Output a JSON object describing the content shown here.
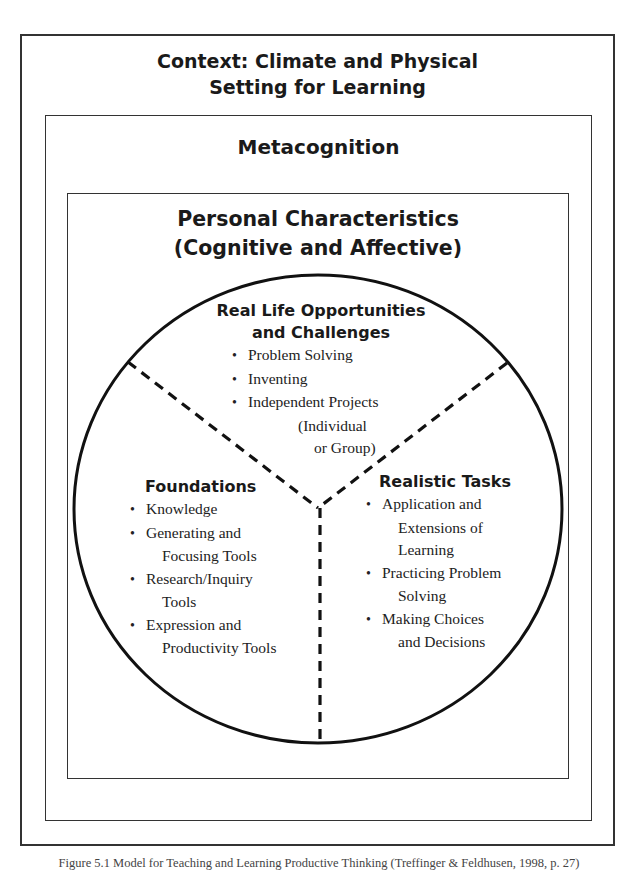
{
  "figure": {
    "outer_box": {
      "title": "Context: Climate and Physical Setting for Learning",
      "title_lines": [
        "Context: Climate and Physical",
        "Setting for Learning"
      ]
    },
    "middle_box": {
      "title": "Metacognition"
    },
    "inner_box": {
      "title": "Personal Characteristics (Cognitive and Affective)",
      "title_lines": [
        "Personal Characteristics",
        "(Cognitive and Affective)"
      ]
    },
    "circle": {
      "sections": [
        {
          "id": "top",
          "title_lines": [
            "Real Life Opportunities",
            "and Challenges"
          ],
          "items": [
            {
              "lines": [
                "Problem Solving"
              ]
            },
            {
              "lines": [
                "Inventing"
              ]
            },
            {
              "lines": [
                "Independent Projects",
                "(Individual",
                "or Group)"
              ]
            }
          ]
        },
        {
          "id": "left",
          "title_lines": [
            "Foundations"
          ],
          "items": [
            {
              "lines": [
                "Knowledge"
              ]
            },
            {
              "lines": [
                "Generating and",
                "Focusing Tools"
              ]
            },
            {
              "lines": [
                "Research/Inquiry",
                "Tools"
              ]
            },
            {
              "lines": [
                "Expression and",
                "Productivity Tools"
              ]
            }
          ]
        },
        {
          "id": "right",
          "title_lines": [
            "Realistic Tasks"
          ],
          "items": [
            {
              "lines": [
                "Application and",
                "Extensions of",
                "Learning"
              ]
            },
            {
              "lines": [
                "Practicing Problem",
                "Solving"
              ]
            },
            {
              "lines": [
                "Making Choices",
                "and Decisions"
              ]
            }
          ]
        }
      ]
    },
    "bullet": "•",
    "caption": "Figure 5.1 Model for Teaching and Learning Productive Thinking (Treffinger & Feldhusen, 1998, p. 27)"
  },
  "colors": {
    "line": "#111111",
    "box_border": "#333333",
    "text": "#1a1a1a",
    "background": "#ffffff"
  }
}
